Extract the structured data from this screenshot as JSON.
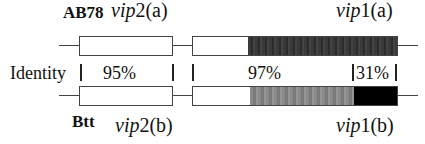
{
  "top": {
    "strain": "AB78",
    "gene_left": {
      "name": "vip",
      "num": "2",
      "suffix": "(a)"
    },
    "gene_right": {
      "name": "vip",
      "num": "1",
      "suffix": "(a)"
    }
  },
  "identity": {
    "label": "Identity",
    "values": [
      "95%",
      "97%",
      "31%"
    ]
  },
  "bottom": {
    "strain": "Btt",
    "gene_left": {
      "name": "vip",
      "num": "2",
      "suffix": "(b)"
    },
    "gene_right": {
      "name": "vip",
      "num": "1",
      "suffix": "(b)"
    }
  },
  "colors": {
    "line": "#444444",
    "dark_region": "#333333",
    "gray_region": "#858585",
    "black_region": "#000000"
  }
}
